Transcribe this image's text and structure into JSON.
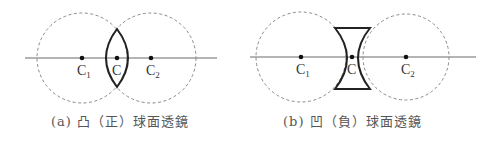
{
  "panels": [
    {
      "id": "a",
      "lens_type": "convex",
      "caption": "(a) 凸（正）球面透鏡",
      "labels": {
        "c1": "C",
        "c1_sub": "1",
        "c": "C",
        "c2": "C",
        "c2_sub": "2"
      }
    },
    {
      "id": "b",
      "lens_type": "concave",
      "caption": "(b) 凹（負）球面透鏡",
      "labels": {
        "c1": "C",
        "c1_sub": "1",
        "c": "C",
        "c2": "C",
        "c2_sub": "2"
      }
    }
  ],
  "colors": {
    "axis": "#6a6a6a",
    "circle": "#8a8a8a",
    "lens": "#222222",
    "text": "#333333"
  }
}
